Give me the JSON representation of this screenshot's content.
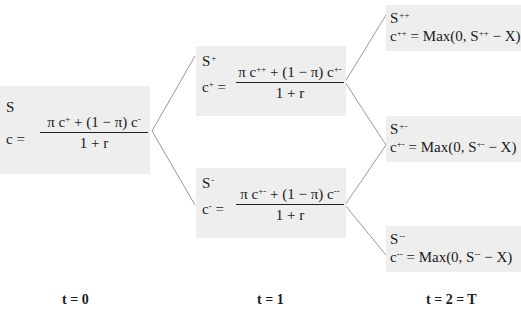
{
  "diagram": {
    "type": "binomial-option-pricing-tree",
    "line_color": "#9a9a9a",
    "node_fill": "#eeeeee",
    "nodes": {
      "root": {
        "symbol": "S",
        "symbol_sup": "",
        "lhs": "c =",
        "lhs_base": "c",
        "lhs_sup": "",
        "numerator": {
          "term1_prefix": "π c",
          "term1_sup": "+",
          "middle": " + (1 − π) c",
          "term2_sup": "-"
        },
        "denominator": "1 + r"
      },
      "up": {
        "symbol": "S",
        "symbol_sup": "+",
        "lhs_base": "c",
        "lhs_sup": "+",
        "lhs_eq": " =",
        "numerator": {
          "term1_prefix": "π c",
          "term1_sup": "++",
          "middle": " + (1 − π) c",
          "term2_sup": "+-"
        },
        "denominator": "1 + r"
      },
      "down": {
        "symbol": "S",
        "symbol_sup": "-",
        "lhs_base": "c",
        "lhs_sup": "-",
        "lhs_eq": " =",
        "numerator": {
          "term1_prefix": "π c",
          "term1_sup": "+-",
          "middle": " + (1 − π) c",
          "term2_sup": "--"
        },
        "denominator": "1 + r"
      },
      "upup": {
        "symbol": "S",
        "symbol_sup": "++",
        "lhs_base": "c",
        "lhs_sup": "++",
        "rhs_prefix": " = Max(0, S",
        "rhs_sup": "++",
        "rhs_suffix": " − X)"
      },
      "updown": {
        "symbol": "S",
        "symbol_sup": "+-",
        "lhs_base": "c",
        "lhs_sup": "+-",
        "rhs_prefix": " = Max(0, S",
        "rhs_sup": "+-",
        "rhs_suffix": " − X)"
      },
      "downdown": {
        "symbol": "S",
        "symbol_sup": "--",
        "lhs_base": "c",
        "lhs_sup": "--",
        "rhs_prefix": " = Max(0, S",
        "rhs_sup": "--",
        "rhs_suffix": " − X)"
      }
    },
    "time_labels": {
      "t0": "t = 0",
      "t1": "t = 1",
      "t2": "t = 2 = T"
    }
  }
}
